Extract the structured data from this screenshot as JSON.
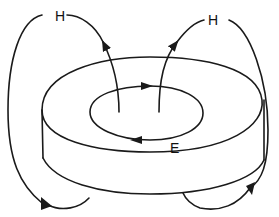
{
  "diagram": {
    "labels": {
      "h_left": "H",
      "h_right": "H",
      "e": "E"
    },
    "colors": {
      "stroke": "#1a1a1a",
      "background": "#ffffff"
    }
  }
}
